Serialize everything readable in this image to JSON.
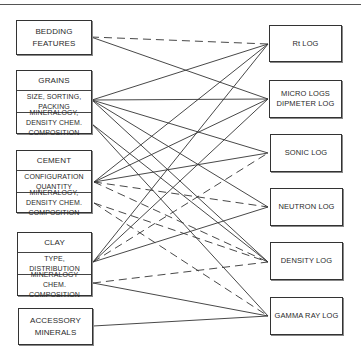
{
  "diagram": {
    "type": "bipartite-relationship",
    "left_nodes": [
      {
        "id": "bedding",
        "title": "BEDDING FEATURES",
        "sections": []
      },
      {
        "id": "grains",
        "title": "GRAINS",
        "sections": [
          "SIZE, SORTING, PACKING",
          "MINERALOGY, DENSITY CHEM. COMPOSITION"
        ]
      },
      {
        "id": "cement",
        "title": "CEMENT",
        "sections": [
          "CONFIGURATION QUANTITY",
          "MINERALOGY, DENSITY CHEM. COMPOSITION"
        ]
      },
      {
        "id": "clay",
        "title": "CLAY",
        "sections": [
          "TYPE, DISTRIBUTION",
          "MINERALOGY CHEM. COMPOSITION"
        ]
      },
      {
        "id": "accessory",
        "title": "ACCESSORY MINERALS",
        "sections": []
      }
    ],
    "right_nodes": [
      {
        "id": "rt",
        "title": "Rt LOG"
      },
      {
        "id": "micro",
        "title": "MICRO LOGS DIPMETER LOG"
      },
      {
        "id": "sonic",
        "title": "SONIC LOG"
      },
      {
        "id": "neutron",
        "title": "NEUTRON LOG"
      },
      {
        "id": "density",
        "title": "DENSITY LOG"
      },
      {
        "id": "gamma",
        "title": "GAMMA RAY LOG"
      }
    ],
    "line_styles": {
      "solid": "strong influence",
      "dashed": "weak influence"
    },
    "edges": [
      {
        "from": "bedding",
        "to": "rt",
        "style": "dashed"
      },
      {
        "from": "bedding",
        "to": "micro",
        "style": "solid"
      },
      {
        "from": "grains.size_sorting_packing",
        "to": "rt",
        "style": "solid"
      },
      {
        "from": "grains.size_sorting_packing",
        "to": "micro",
        "style": "solid"
      },
      {
        "from": "grains.size_sorting_packing",
        "to": "sonic",
        "style": "solid"
      },
      {
        "from": "grains.size_sorting_packing",
        "to": "neutron",
        "style": "solid"
      },
      {
        "from": "grains.size_sorting_packing",
        "to": "density",
        "style": "solid"
      },
      {
        "from": "grains.mineralogy",
        "to": "density",
        "style": "solid"
      },
      {
        "from": "grains.mineralogy",
        "to": "gamma",
        "style": "solid"
      },
      {
        "from": "cement.configuration_quantity",
        "to": "rt",
        "style": "solid"
      },
      {
        "from": "cement.configuration_quantity",
        "to": "micro",
        "style": "solid"
      },
      {
        "from": "cement.configuration_quantity",
        "to": "sonic",
        "style": "solid"
      },
      {
        "from": "cement.configuration_quantity",
        "to": "neutron",
        "style": "dashed"
      },
      {
        "from": "cement.configuration_quantity",
        "to": "density",
        "style": "dashed"
      },
      {
        "from": "cement.mineralogy",
        "to": "density",
        "style": "dashed"
      },
      {
        "from": "cement.mineralogy",
        "to": "gamma",
        "style": "dashed"
      },
      {
        "from": "clay.type_distribution",
        "to": "rt",
        "style": "solid"
      },
      {
        "from": "clay.type_distribution",
        "to": "micro",
        "style": "solid"
      },
      {
        "from": "clay.type_distribution",
        "to": "sonic",
        "style": "dashed"
      },
      {
        "from": "clay.type_distribution",
        "to": "neutron",
        "style": "solid"
      },
      {
        "from": "clay.mineralogy",
        "to": "density",
        "style": "dashed"
      },
      {
        "from": "clay.mineralogy",
        "to": "gamma",
        "style": "solid"
      },
      {
        "from": "accessory",
        "to": "gamma",
        "style": "solid"
      }
    ]
  }
}
